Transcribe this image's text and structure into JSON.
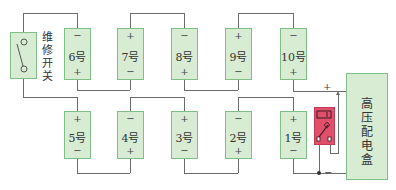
{
  "switch": {
    "label_chars": [
      "维",
      "修",
      "开",
      "关"
    ]
  },
  "batteries_top": [
    {
      "label": "6号",
      "top": "−",
      "bottom": "+"
    },
    {
      "label": "7号",
      "top": "+",
      "bottom": "−"
    },
    {
      "label": "8号",
      "top": "−",
      "bottom": "+"
    },
    {
      "label": "9号",
      "top": "+",
      "bottom": "−"
    },
    {
      "label": "10号",
      "top": "−",
      "bottom": "+"
    }
  ],
  "batteries_bottom": [
    {
      "label": "5号",
      "top": "+",
      "bottom": "−"
    },
    {
      "label": "4号",
      "top": "−",
      "bottom": "+"
    },
    {
      "label": "3号",
      "top": "+",
      "bottom": "−"
    },
    {
      "label": "2号",
      "top": "−",
      "bottom": "+"
    },
    {
      "label": "1号",
      "top": "+",
      "bottom": "−"
    }
  ],
  "hv_box": {
    "label_chars": [
      "高",
      "压",
      "配",
      "电",
      "盒"
    ]
  },
  "multimeter": {
    "color": "#e0506a"
  },
  "terminals": {
    "positive": "+",
    "negative": "−"
  },
  "colors": {
    "box_fill": "#d8ecd4",
    "box_border": "#7fbf85",
    "wire": "#6b6b6b"
  }
}
